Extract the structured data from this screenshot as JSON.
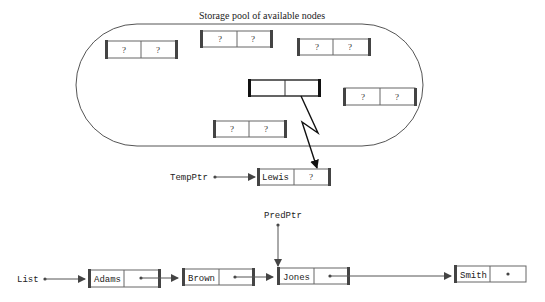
{
  "pool": {
    "title": "Storage pool of available nodes",
    "unknown": "?"
  },
  "temp": {
    "pointer_label": "TempPtr",
    "node_value": "Lewis",
    "node_next": "?"
  },
  "pred": {
    "pointer_label": "PredPtr"
  },
  "list": {
    "pointer_label": "List",
    "nodes": [
      {
        "value": "Adams"
      },
      {
        "value": "Brown"
      },
      {
        "value": "Jones"
      },
      {
        "value": "Smith"
      }
    ]
  }
}
